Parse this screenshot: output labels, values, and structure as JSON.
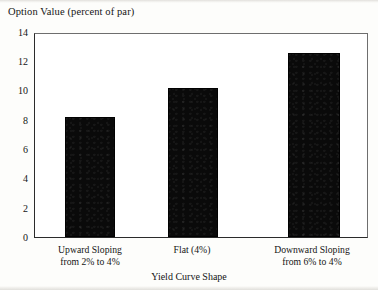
{
  "figure": {
    "y_axis_caption": "Option Value (percent of par)",
    "x_axis_title": "Yield Curve Shape"
  },
  "chart_data": {
    "type": "bar",
    "title": "Option Value (percent of par)",
    "xlabel": "Yield Curve Shape",
    "ylabel": "Option Value (percent of par)",
    "categories": [
      "Upward Sloping from 2% to 4%",
      "Flat (4%)",
      "Downward Sloping from 6% to 4%"
    ],
    "category_lines": [
      [
        "Upward Sloping",
        "from 2% to 4%"
      ],
      [
        "Flat (4%)",
        ""
      ],
      [
        "Downward Sloping",
        "from 6% to 4%"
      ]
    ],
    "values": [
      8.3,
      10.3,
      12.7
    ],
    "ylim": [
      0,
      14
    ],
    "ytick_labels": [
      "0",
      "2",
      "4",
      "6",
      "8",
      "10",
      "12",
      "14"
    ],
    "ytick_values": [
      0,
      2,
      4,
      6,
      8,
      10,
      12,
      14
    ],
    "grid": false,
    "legend": false,
    "bar_color": "#0a0a0a",
    "frame_color": "#2b2b2b",
    "background": "#ffffff"
  }
}
